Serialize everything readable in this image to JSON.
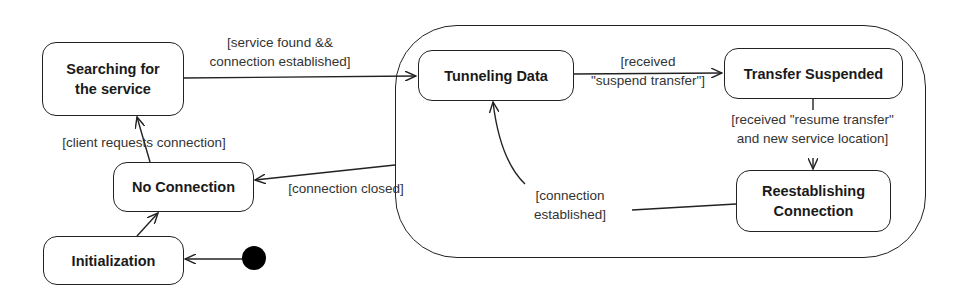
{
  "diagram": {
    "type": "UML state machine",
    "states": [
      {
        "id": "searching",
        "label_line1": "Searching for",
        "label_line2": "the service"
      },
      {
        "id": "no_connection",
        "label": "No Connection"
      },
      {
        "id": "initialization",
        "label": "Initialization"
      },
      {
        "id": "tunneling",
        "label": "Tunneling Data"
      },
      {
        "id": "suspended",
        "label": "Transfer Suspended"
      },
      {
        "id": "reestablishing",
        "label_line1": "Reestablishing",
        "label_line2": "Connection"
      }
    ],
    "transitions": [
      {
        "from": "initial",
        "to": "initialization",
        "guard": ""
      },
      {
        "from": "initialization",
        "to": "no_connection",
        "guard": ""
      },
      {
        "from": "no_connection",
        "to": "searching",
        "guard": "[client requests connection]"
      },
      {
        "from": "searching",
        "to": "superstate",
        "guard_line1": "[service found &&",
        "guard_line2": "connection established]"
      },
      {
        "from": "tunneling",
        "to": "suspended",
        "guard_line1": "[received",
        "guard_line2": "\"suspend transfer\"]"
      },
      {
        "from": "suspended",
        "to": "reestablishing",
        "guard_line1": "[received \"resume transfer\"",
        "guard_line2": "and new service location]"
      },
      {
        "from": "reestablishing",
        "to": "tunneling",
        "guard_line1": "[connection",
        "guard_line2": "established]"
      },
      {
        "from": "superstate",
        "to": "no_connection",
        "guard": "[connection closed]"
      }
    ]
  }
}
